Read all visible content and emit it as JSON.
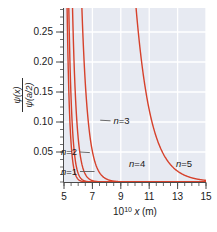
{
  "chart_data": {
    "type": "line",
    "title": "",
    "subtitle": "",
    "xlabel": "10^10 x (m)",
    "ylabel": "psi(x) / psi(a/2)",
    "xlabel_parts": {
      "base": "10",
      "exponent": "10",
      "variable": "x",
      "unit": "(m)"
    },
    "ylabel_parts": {
      "numerator_psi": "ψ",
      "numerator_arg": "(x)",
      "denominator_psi": "ψ",
      "denominator_arg": "(a/2)"
    },
    "xlim": [
      5,
      15
    ],
    "ylim": [
      0,
      0.29
    ],
    "xticks": [
      5,
      7,
      9,
      11,
      13,
      15
    ],
    "xtick_labels": [
      "5",
      "7",
      "9",
      "11",
      "13",
      "15"
    ],
    "xminor_step": 0.5,
    "yticks": [
      0.05,
      0.1,
      0.15,
      0.2,
      0.25
    ],
    "ytick_labels": [
      "0.05",
      "0.10",
      "0.15",
      "0.20",
      "0.25"
    ],
    "yminor_step": 0.0125,
    "grid": true,
    "grid_color": "#ffffff",
    "plot_bg": "#e7eaf2",
    "curve_color": "#d6412b",
    "curve_width": 1.4,
    "legend_position": "inline-annotations",
    "series": [
      {
        "name": "n=1",
        "label": "n=1",
        "decay_k": 5.35,
        "x_ref": 5.0,
        "y_ref": 0.93,
        "points_x": [
          5.0,
          5.2,
          5.4,
          5.6,
          5.8,
          6.0,
          6.2,
          6.4,
          6.6,
          6.8,
          7.0,
          7.3,
          7.6,
          8.0,
          8.5,
          9.0,
          10.0,
          11.0,
          12.0,
          13.0,
          14.0,
          15.0
        ],
        "points_y": [
          0.93,
          0.318,
          0.1092,
          0.0375,
          0.01287,
          0.00442,
          0.00152,
          0.00052,
          0.00018,
          6e-05,
          2e-05,
          0.0,
          0.0,
          0.0,
          0.0,
          0.0,
          0.0,
          0.0,
          0.0,
          0.0,
          0.0,
          0.0
        ]
      },
      {
        "name": "n=2",
        "label": "n=2",
        "decay_k": 4.55,
        "x_ref": 5.0,
        "y_ref": 1.35,
        "points_x": [
          5.0,
          5.2,
          5.4,
          5.6,
          5.8,
          6.0,
          6.2,
          6.4,
          6.6,
          6.8,
          7.0,
          7.3,
          7.6,
          8.0,
          8.5,
          9.0,
          10.0,
          11.0,
          12.0,
          13.0,
          14.0,
          15.0
        ],
        "points_y": [
          1.35,
          0.543,
          0.2185,
          0.0879,
          0.0354,
          0.01424,
          0.00573,
          0.0023,
          0.00093,
          0.00037,
          0.00015,
          4e-05,
          1e-05,
          0.0,
          0.0,
          0.0,
          0.0,
          0.0,
          0.0,
          0.0,
          0.0,
          0.0
        ]
      },
      {
        "name": "n=3",
        "label": "n=3",
        "decay_k": 3.45,
        "x_ref": 5.0,
        "y_ref": 2.3,
        "points_x": [
          5.0,
          5.3,
          5.6,
          5.9,
          6.2,
          6.5,
          6.8,
          7.1,
          7.4,
          7.7,
          8.0,
          8.5,
          9.0,
          9.5,
          10.0,
          11.0,
          12.0,
          13.0,
          14.0,
          15.0
        ],
        "points_y": [
          2.3,
          0.8183,
          0.2911,
          0.1036,
          0.0368,
          0.0131,
          0.00466,
          0.00166,
          0.00059,
          0.00021,
          7e-05,
          1e-05,
          0.0,
          0.0,
          0.0,
          0.0,
          0.0,
          0.0,
          0.0,
          0.0
        ]
      },
      {
        "name": "n=4",
        "label": "n=4",
        "decay_k": 2.35,
        "x_ref": 5.0,
        "y_ref": 5.6,
        "points_x": [
          5.0,
          5.5,
          6.0,
          6.5,
          7.0,
          7.5,
          8.0,
          8.5,
          9.0,
          9.5,
          10.0,
          10.5,
          11.0,
          12.0,
          13.0,
          14.0,
          15.0
        ],
        "points_y": [
          5.6,
          1.7259,
          0.5319,
          0.1639,
          0.0505,
          0.01557,
          0.0048,
          0.00148,
          0.00046,
          0.00014,
          4e-05,
          1e-05,
          0.0,
          0.0,
          0.0,
          0.0,
          0.0
        ]
      },
      {
        "name": "n=5",
        "label": "n=5",
        "decay_k": 0.95,
        "x_ref": 5.0,
        "y_ref": 36.0,
        "points_x": [
          5.0,
          5.5,
          6.0,
          6.5,
          7.0,
          7.5,
          8.0,
          8.5,
          9.0,
          9.5,
          10.0,
          10.5,
          11.0,
          11.5,
          12.0,
          12.5,
          13.0,
          13.5,
          14.0,
          14.5,
          15.0
        ],
        "points_y": [
          36.0,
          22.38,
          13.91,
          8.647,
          5.376,
          3.342,
          2.077,
          1.291,
          0.8027,
          0.499,
          0.3102,
          0.1928,
          0.1199,
          0.0745,
          0.0463,
          0.0288,
          0.0179,
          0.0111,
          0.0069,
          0.0043,
          0.0027
        ]
      }
    ],
    "annotations": [
      {
        "text": "n=3",
        "x_data": 9.05,
        "y_data": 0.102,
        "leader_to_x": 7.55,
        "leader_to_y": 0.103
      },
      {
        "text": "n=2",
        "x_data": 5.35,
        "y_data": 0.05,
        "leader_to_x": 6.82,
        "leader_to_y": 0.049
      },
      {
        "text": "n=1",
        "x_data": 5.35,
        "y_data": 0.0175,
        "leader_to_x": 7.15,
        "leader_to_y": 0.0175
      },
      {
        "text": "n=4",
        "x_data": 10.15,
        "y_data": 0.0305,
        "leader_to_x": null,
        "leader_to_y": null
      },
      {
        "text": "n=5",
        "x_data": 13.45,
        "y_data": 0.0305,
        "leader_to_x": null,
        "leader_to_y": null
      }
    ]
  }
}
